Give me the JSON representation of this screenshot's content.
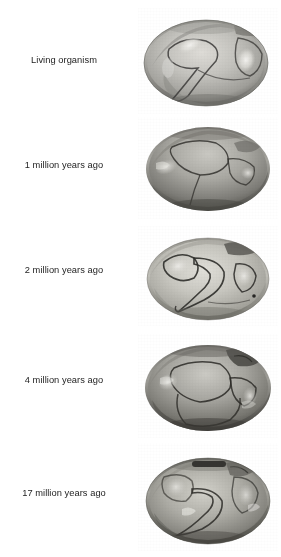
{
  "figure": {
    "background_color": "#ffffff",
    "text_color": "#1d1d1d",
    "specimen_type": "bivalve-shell-photograph",
    "rows": [
      {
        "label": "Living organism",
        "specimen_name": "shell-specimen-living",
        "age_value": 0,
        "age_unit": "million years ago",
        "tone_light": "#d6d6d2",
        "tone_mid": "#a9a9a5",
        "tone_dark": "#6e6e6b",
        "tone_shadow": "#4b4b49"
      },
      {
        "label": "1 million years ago",
        "specimen_name": "shell-specimen-1ma",
        "age_value": 1,
        "age_unit": "million years ago",
        "tone_light": "#c9c8c2",
        "tone_mid": "#9a9993",
        "tone_dark": "#5f5e5a",
        "tone_shadow": "#3a3a38"
      },
      {
        "label": "2 million years ago",
        "specimen_name": "shell-specimen-2ma",
        "age_value": 2,
        "age_unit": "million years ago",
        "tone_light": "#d9d8d2",
        "tone_mid": "#b0afa8",
        "tone_dark": "#76756f",
        "tone_shadow": "#4f4f4c"
      },
      {
        "label": "4 million years ago",
        "specimen_name": "shell-specimen-4ma",
        "age_value": 4,
        "age_unit": "million years ago",
        "tone_light": "#c4c3bd",
        "tone_mid": "#93928c",
        "tone_dark": "#5a5955",
        "tone_shadow": "#343433"
      },
      {
        "label": "17 million years ago",
        "specimen_name": "shell-specimen-17ma",
        "age_value": 17,
        "age_unit": "million years ago",
        "tone_light": "#cfcec7",
        "tone_mid": "#a09f98",
        "tone_dark": "#65645f",
        "tone_shadow": "#3c3c3a"
      }
    ]
  }
}
